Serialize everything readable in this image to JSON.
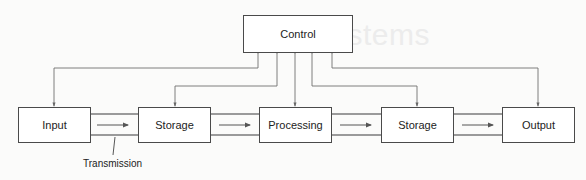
{
  "diagram": {
    "background_text": "gital Systems",
    "control": {
      "label": "Control"
    },
    "blocks": [
      {
        "id": "input",
        "label": "Input"
      },
      {
        "id": "storage1",
        "label": "Storage"
      },
      {
        "id": "processing",
        "label": "Processing"
      },
      {
        "id": "storage2",
        "label": "Storage"
      },
      {
        "id": "output",
        "label": "Output"
      }
    ],
    "transmission_label": "Transmission",
    "colors": {
      "box_border": "#4a4a4a",
      "control_lines": "#707070",
      "arrows": "#555555"
    }
  }
}
